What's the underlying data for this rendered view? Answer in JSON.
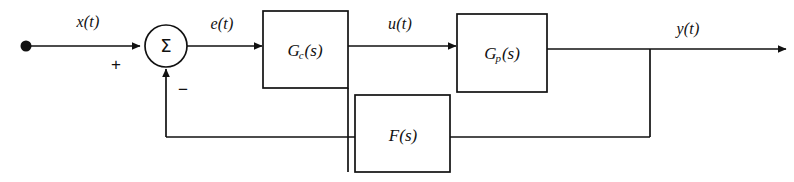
{
  "figure": {
    "kind": "control-system-block-diagram",
    "background_color": "#ffffff",
    "line_color": "#111111"
  },
  "signals": {
    "input": "x(t)",
    "error": "e(t)",
    "control": "u(t)",
    "output": "y(t)"
  },
  "summing_junction": {
    "glyph": "Σ",
    "plus_sign": "+",
    "minus_sign": "−"
  },
  "blocks": [
    {
      "id": "controller",
      "label_main": "G",
      "label_sub": "c",
      "label_arg": "(s)"
    },
    {
      "id": "plant",
      "label_main": "G",
      "label_sub": "p",
      "label_arg": "(s)"
    },
    {
      "id": "feedback",
      "label_main": "F",
      "label_sub": "",
      "label_arg": "(s)"
    }
  ]
}
